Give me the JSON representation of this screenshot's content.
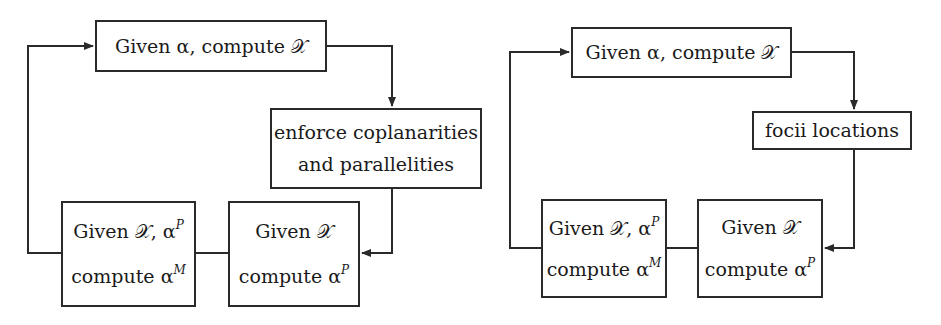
{
  "diagrams": [
    {
      "id": "left",
      "boxes": {
        "top": {
          "lines": [
            "Given α, compute 𝒳"
          ]
        },
        "side": {
          "lines": [
            "enforce coplanarities",
            "and parallelities"
          ]
        },
        "bottom_right": {
          "lines": [
            "Given 𝒳",
            "compute α"
          ],
          "sup": "P"
        },
        "bottom_left": {
          "lines": [
            "Given 𝒳, α",
            "compute α"
          ],
          "sup1": "P",
          "sup2": "M"
        }
      }
    },
    {
      "id": "right",
      "boxes": {
        "top": {
          "lines": [
            "Given α, compute 𝒳"
          ]
        },
        "side": {
          "lines": [
            "focii locations"
          ]
        },
        "bottom_right": {
          "lines": [
            "Given 𝒳",
            "compute α"
          ],
          "sup": "P"
        },
        "bottom_left": {
          "lines": [
            "Given 𝒳, α",
            "compute α"
          ],
          "sup1": "P",
          "sup2": "M"
        }
      }
    }
  ],
  "colors": {
    "line": "#2a2a2a",
    "background": "#ffffff"
  }
}
